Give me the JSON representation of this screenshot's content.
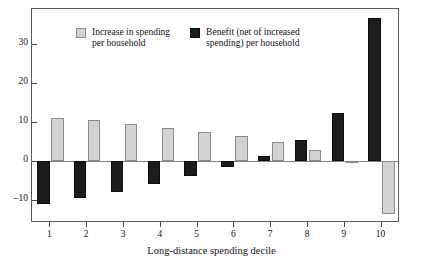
{
  "chart_data": {
    "type": "bar",
    "title": "",
    "subtitle": "",
    "xlabel": "Long-distance spending decile",
    "ylabel": "",
    "categories": [
      "1",
      "2",
      "3",
      "4",
      "5",
      "6",
      "7",
      "8",
      "9",
      "10"
    ],
    "series": [
      {
        "name": "Increase in spending per household",
        "color": "#d2d2d2",
        "values": [
          11.1,
          10.4,
          9.4,
          8.5,
          7.4,
          6.4,
          4.8,
          2.7,
          -0.5,
          -13.6
        ]
      },
      {
        "name": "Benefit (net of increased spending) per household",
        "color": "#1c1c1c",
        "values": [
          -11.2,
          -9.7,
          -8.1,
          -6.0,
          -3.9,
          -1.5,
          1.3,
          5.3,
          12.2,
          36.8
        ]
      }
    ],
    "ylim": [
      -16,
      39
    ],
    "yticks": [
      -10,
      0,
      10,
      20,
      30
    ],
    "ytick_labels": [
      "–10",
      "0",
      "10",
      "20",
      "30"
    ],
    "grid": false,
    "legend_position": "top-left",
    "zero_line": 0
  },
  "legend": {
    "items": [
      {
        "label": "Increase in spending\nper household",
        "swatch": "gray"
      },
      {
        "label": "Benefit (net of increased\nspending) per household",
        "swatch": "dark"
      }
    ]
  },
  "axis": {
    "x_title": "Long-distance spending decile"
  }
}
